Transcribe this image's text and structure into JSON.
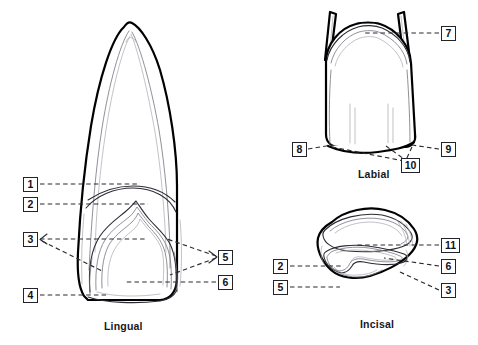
{
  "figure": {
    "background_color": "#ffffff",
    "outline_color": "#000000",
    "leader_color": "#2b2b33",
    "box_border_color": "#23232b"
  },
  "views": [
    {
      "id": "lingual",
      "caption": "Lingual",
      "caption_x": 104,
      "caption_y": 320
    },
    {
      "id": "labial",
      "caption": "Labial",
      "caption_x": 358,
      "caption_y": 168
    },
    {
      "id": "incisal",
      "caption": "Incisal",
      "caption_x": 360,
      "caption_y": 318
    }
  ],
  "callouts": [
    {
      "id": "lingual-1",
      "label": "1",
      "x": 23,
      "y": 177,
      "size": "w1",
      "view": "lingual"
    },
    {
      "id": "lingual-2",
      "label": "2",
      "x": 23,
      "y": 197,
      "size": "w1",
      "view": "lingual"
    },
    {
      "id": "lingual-3",
      "label": "3",
      "x": 23,
      "y": 232,
      "size": "w1",
      "view": "lingual"
    },
    {
      "id": "lingual-4",
      "label": "4",
      "x": 23,
      "y": 288,
      "size": "w1",
      "view": "lingual"
    },
    {
      "id": "lingual-5",
      "label": "5",
      "x": 218,
      "y": 250,
      "size": "w1",
      "view": "lingual"
    },
    {
      "id": "lingual-6",
      "label": "6",
      "x": 218,
      "y": 275,
      "size": "w1",
      "view": "lingual"
    },
    {
      "id": "labial-7",
      "label": "7",
      "x": 441,
      "y": 26,
      "size": "w1",
      "view": "labial"
    },
    {
      "id": "labial-8",
      "label": "8",
      "x": 292,
      "y": 142,
      "size": "w1",
      "view": "labial"
    },
    {
      "id": "labial-9",
      "label": "9",
      "x": 441,
      "y": 142,
      "size": "w1",
      "view": "labial"
    },
    {
      "id": "labial-10",
      "label": "10",
      "x": 401,
      "y": 158,
      "size": "w2",
      "view": "labial"
    },
    {
      "id": "incisal-11",
      "label": "11",
      "x": 441,
      "y": 238,
      "size": "w2",
      "view": "incisal"
    },
    {
      "id": "incisal-2",
      "label": "2",
      "x": 273,
      "y": 259,
      "size": "w1",
      "view": "incisal"
    },
    {
      "id": "incisal-6",
      "label": "6",
      "x": 441,
      "y": 259,
      "size": "w1",
      "view": "incisal"
    },
    {
      "id": "incisal-5",
      "label": "5",
      "x": 273,
      "y": 280,
      "size": "w1",
      "view": "incisal"
    },
    {
      "id": "incisal-3",
      "label": "3",
      "x": 441,
      "y": 283,
      "size": "w1",
      "view": "incisal"
    }
  ]
}
